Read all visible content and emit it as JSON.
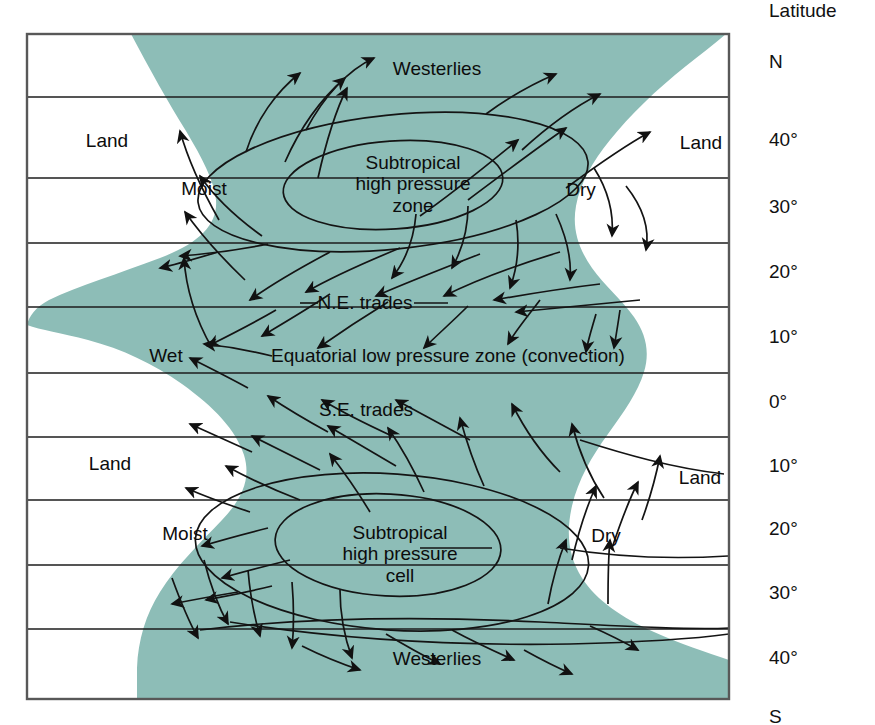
{
  "figure": {
    "type": "diagram",
    "colors": {
      "ocean": "#8dbdb7",
      "land": "#ffffff",
      "line": "#1a1a1a",
      "text": "#0c0c0c",
      "frame": "#555555"
    },
    "frame": {
      "x": 26,
      "y": 33,
      "width": 704,
      "height": 667
    }
  },
  "axis": {
    "title": "Latitude",
    "ticks": [
      {
        "label": "N",
        "y": 63
      },
      {
        "label": "40°",
        "y": 141
      },
      {
        "label": "30°",
        "y": 208
      },
      {
        "label": "20°",
        "y": 273
      },
      {
        "label": "10°",
        "y": 338
      },
      {
        "label": "0°",
        "y": 403
      },
      {
        "label": "10°",
        "y": 467
      },
      {
        "label": "20°",
        "y": 530
      },
      {
        "label": "30°",
        "y": 594
      },
      {
        "label": "40°",
        "y": 659
      },
      {
        "label": "S",
        "y": 718
      }
    ],
    "gridlines_y": [
      97,
      178,
      243,
      307,
      373,
      437,
      500,
      565,
      629
    ]
  },
  "map_labels": [
    {
      "name": "westerlies-north",
      "text": "Westerlies",
      "x": 437,
      "y": 69,
      "align": "center"
    },
    {
      "name": "land-north-west",
      "text": "Land",
      "x": 107,
      "y": 141,
      "align": "center"
    },
    {
      "name": "land-north-east",
      "text": "Land",
      "x": 701,
      "y": 143,
      "align": "center"
    },
    {
      "name": "moist-north",
      "text": "Moist",
      "x": 204,
      "y": 189,
      "align": "center"
    },
    {
      "name": "dry-north",
      "text": "Dry",
      "x": 581,
      "y": 190,
      "align": "center"
    },
    {
      "name": "ne-trades",
      "text": "N.E. trades",
      "x": 365,
      "y": 303,
      "align": "center"
    },
    {
      "name": "wet-label",
      "text": "Wet",
      "x": 166,
      "y": 356,
      "align": "center"
    },
    {
      "name": "equatorial-low",
      "text": "Equatorial low pressure zone (convection)",
      "x": 448,
      "y": 356,
      "align": "center"
    },
    {
      "name": "se-trades",
      "text": "S.E. trades",
      "x": 366,
      "y": 410,
      "align": "center"
    },
    {
      "name": "land-south-west",
      "text": "Land",
      "x": 110,
      "y": 464,
      "align": "center"
    },
    {
      "name": "land-south-east",
      "text": "Land",
      "x": 700,
      "y": 478,
      "align": "center"
    },
    {
      "name": "moist-south",
      "text": "Moist",
      "x": 185,
      "y": 534,
      "align": "center"
    },
    {
      "name": "dry-south",
      "text": "Dry",
      "x": 606,
      "y": 536,
      "align": "center"
    },
    {
      "name": "westerlies-south",
      "text": "Westerlies",
      "x": 437,
      "y": 659,
      "align": "center"
    }
  ],
  "pressure_cells": [
    {
      "name": "subtropical-high-north",
      "lines": [
        "Subtropical",
        "high pressure",
        "zone"
      ],
      "x": 413,
      "y": 163,
      "ellipse_outer": {
        "cx": 393,
        "cy": 182,
        "rx": 196,
        "ry": 67,
        "rotate": -6
      },
      "ellipse_inner": {
        "cx": 393,
        "cy": 185,
        "rx": 110,
        "ry": 44,
        "rotate": -4
      }
    },
    {
      "name": "subtropical-high-south",
      "lines": [
        "Subtropical",
        "high pressure",
        "cell"
      ],
      "x": 400,
      "y": 533,
      "ellipse_outer": {
        "cx": 392,
        "cy": 552,
        "rx": 197,
        "ry": 78,
        "rotate": 4
      },
      "ellipse_inner": {
        "cx": 388,
        "cy": 545,
        "rx": 113,
        "ry": 51,
        "rotate": 3
      }
    }
  ],
  "ocean_boundaries": {
    "west_coast_description": "Concave coastline: ocean bulges west near 20°N-0° and near 30°S-40°S",
    "east_coast_description": "Convex land mass intruding west near 30°N and 20°S-30°S"
  }
}
